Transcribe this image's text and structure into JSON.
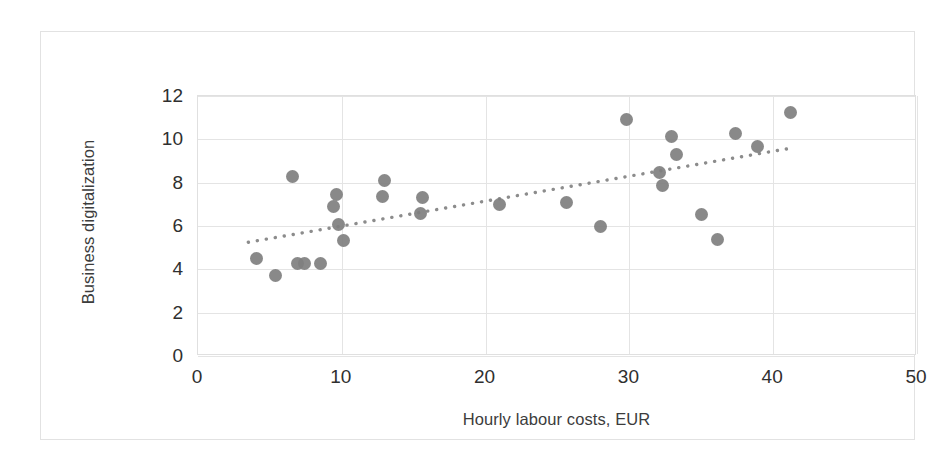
{
  "chart_data": {
    "type": "scatter",
    "title": "",
    "xlabel": "Hourly labour costs, EUR",
    "ylabel": "Business digitalization",
    "xlim": [
      0,
      50
    ],
    "ylim": [
      0,
      12
    ],
    "xticks": [
      0,
      10,
      20,
      30,
      40,
      50
    ],
    "yticks": [
      0,
      2,
      4,
      6,
      8,
      10,
      12
    ],
    "xtick_labels": [
      "0",
      "10",
      "20",
      "30",
      "40",
      "50"
    ],
    "ytick_labels": [
      "0",
      "2",
      "4",
      "6",
      "8",
      "10",
      "12"
    ],
    "grid": "horizontal-and-vertical",
    "legend": "none",
    "marker_color": "#7f7f7f",
    "marker_size_px": 13,
    "trendline": {
      "type": "linear-dotted",
      "color": "#8c8c8c",
      "x_start": 3.5,
      "y_start": 5.25,
      "x_end": 41.3,
      "y_end": 9.6
    },
    "points": [
      {
        "x": 4.1,
        "y": 4.5
      },
      {
        "x": 5.4,
        "y": 3.7
      },
      {
        "x": 6.6,
        "y": 8.3
      },
      {
        "x": 6.9,
        "y": 4.25
      },
      {
        "x": 7.4,
        "y": 4.25
      },
      {
        "x": 8.5,
        "y": 4.25
      },
      {
        "x": 9.6,
        "y": 7.45
      },
      {
        "x": 9.4,
        "y": 6.9
      },
      {
        "x": 9.8,
        "y": 6.05
      },
      {
        "x": 10.1,
        "y": 5.35
      },
      {
        "x": 13.0,
        "y": 8.1
      },
      {
        "x": 12.8,
        "y": 7.35
      },
      {
        "x": 15.6,
        "y": 7.3
      },
      {
        "x": 15.5,
        "y": 6.6
      },
      {
        "x": 21.0,
        "y": 7.0
      },
      {
        "x": 25.6,
        "y": 7.1
      },
      {
        "x": 28.0,
        "y": 6.0
      },
      {
        "x": 29.8,
        "y": 10.9
      },
      {
        "x": 32.9,
        "y": 10.15
      },
      {
        "x": 32.1,
        "y": 8.45
      },
      {
        "x": 32.3,
        "y": 7.85
      },
      {
        "x": 35.0,
        "y": 6.55
      },
      {
        "x": 36.1,
        "y": 5.4
      },
      {
        "x": 33.3,
        "y": 9.3
      },
      {
        "x": 37.4,
        "y": 10.25
      },
      {
        "x": 38.9,
        "y": 9.65
      },
      {
        "x": 41.2,
        "y": 11.25
      }
    ]
  }
}
